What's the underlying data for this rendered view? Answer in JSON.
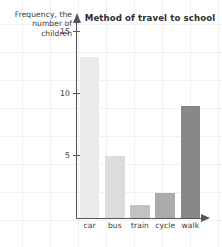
{
  "chart_data": {
    "type": "bar",
    "title": "Method of travel to school",
    "xlabel": "",
    "ylabel": "Frequency, the number of children",
    "categories": [
      "car",
      "bus",
      "train",
      "cycle",
      "walk"
    ],
    "values": [
      13,
      5,
      1,
      2,
      9
    ],
    "bar_colors": [
      "#ebebeb",
      "#dcdcdc",
      "#c2c2c2",
      "#ababab",
      "#888888"
    ],
    "ylim": [
      0,
      15.8
    ],
    "yticks": [
      5,
      10,
      15
    ],
    "ytick_labels": [
      "5",
      "10",
      "15"
    ],
    "grid": true,
    "legend": false
  },
  "ylabel_lines": [
    "Frequency, the",
    "number of",
    "children"
  ],
  "colors": {
    "axis": "#555555",
    "text": "#3b3b3b",
    "title": "#2e2e2e",
    "grid": "#f0f0f0",
    "background": "#ffffff"
  }
}
